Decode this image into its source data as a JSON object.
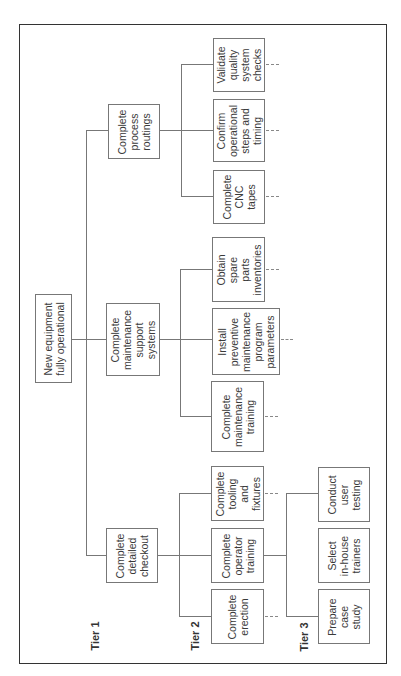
{
  "diagram": {
    "type": "work breakdown structure",
    "orientation": "rotated 90 degrees counter-clockwise",
    "tiers": [
      "Tier 1",
      "Tier 2",
      "Tier 3"
    ],
    "root": {
      "label": "New equipment\nfully operational"
    },
    "tier1": [
      {
        "id": "checkout",
        "label": "Complete\ndetailed\ncheckout"
      },
      {
        "id": "maintenance",
        "label": "Complete\nmaintenance\nsupport\nsystems"
      },
      {
        "id": "routings",
        "label": "Complete\nprocess\nroutings"
      }
    ],
    "tier2": {
      "checkout": [
        {
          "id": "erection",
          "label": "Complete\nerection"
        },
        {
          "id": "operator",
          "label": "Complete\noperator\ntraining"
        },
        {
          "id": "tooling",
          "label": "Complete\ntooling\nand\nfixtures"
        }
      ],
      "maintenance": [
        {
          "id": "maint_training",
          "label": "Complete\nmaintenance\ntraining"
        },
        {
          "id": "preventive",
          "label": "Install\npreventive\nmaintenance\nprogram\nparameters"
        },
        {
          "id": "spares",
          "label": "Obtain\nspare\nparts\ninventories"
        }
      ],
      "routings": [
        {
          "id": "cnc",
          "label": "Complete\nCNC\ntapes"
        },
        {
          "id": "steps",
          "label": "Confirm\noperational\nsteps and\ntiming"
        },
        {
          "id": "quality",
          "label": "Validate\nquality\nsystem\nchecks"
        }
      ]
    },
    "tier3": {
      "operator": [
        {
          "id": "case_study",
          "label": "Prepare\ncase\nstudy"
        },
        {
          "id": "trainers",
          "label": "Select\nin-house\ntrainers"
        },
        {
          "id": "user_testing",
          "label": "Conduct\nuser\ntesting"
        }
      ]
    },
    "colors": {
      "frame": "#333333",
      "box_border": "#777777",
      "text": "#3a3a3a",
      "connector": "#777777"
    }
  }
}
